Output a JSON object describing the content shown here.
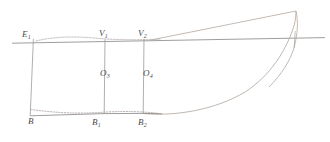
{
  "figure": {
    "canvas": {
      "width": 330,
      "height": 142
    },
    "stroke_colors": {
      "waterline": "#8a8a8a",
      "station": "#9a9a9a",
      "hull_curve": "#b0a8a0",
      "dotted_curve": "#a09890",
      "baseline": "#8a8a8a",
      "label_text": "#4a4a4a"
    },
    "labels": {
      "E1": {
        "base": "E",
        "sub": "1",
        "x": 22,
        "y": 31
      },
      "V1": {
        "base": "V",
        "sub": "1",
        "x": 99,
        "y": 30
      },
      "V2": {
        "base": "V",
        "sub": "2",
        "x": 139,
        "y": 30
      },
      "O3": {
        "base": "O",
        "sub": "3",
        "x": 100,
        "y": 70
      },
      "O4": {
        "base": "O",
        "sub": "4",
        "x": 143,
        "y": 70
      },
      "B": {
        "base": "B",
        "sub": "",
        "x": 28,
        "y": 115
      },
      "B1": {
        "base": "B",
        "sub": "1",
        "x": 92,
        "y": 118
      },
      "B2": {
        "base": "B",
        "sub": "2",
        "x": 138,
        "y": 118
      }
    },
    "geometry": {
      "waterline": {
        "x1": 12,
        "y1": 43,
        "x2": 325,
        "y2": 38
      },
      "station_E1": {
        "x1": 33,
        "y1": 39,
        "x2": 30,
        "y2": 116
      },
      "station_V1": {
        "x1": 105,
        "y1": 40,
        "x2": 104,
        "y2": 114
      },
      "station_V2": {
        "x1": 144,
        "y1": 40,
        "x2": 143,
        "y2": 113
      },
      "station_right": {
        "x1": 295,
        "y1": 34,
        "x2": 294,
        "y2": 46
      },
      "baseline": {
        "x1": 30,
        "y1": 116,
        "x2": 160,
        "y2": 112
      },
      "deck_diagonal": {
        "x1": 160,
        "y1": 39,
        "x2": 296,
        "y2": 11
      },
      "sheer_curve": "M 36,41 C 60,35 85,37 105,39 C 125,40 145,40 160,39",
      "bottom_dotted_curve": "M 31,110 C 55,113 80,114 104,112 C 125,111 145,112 158,113",
      "hull_profile_curve": "M 147,113 C 185,116 235,100 268,66 C 286,47 294,28 296,11",
      "stem_curve": "M 296,11 C 298,22 297,34 294,46 C 290,60 280,74 268,86"
    }
  }
}
